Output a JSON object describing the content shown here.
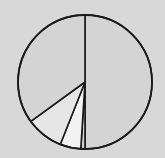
{
  "chart_data": {
    "type": "pie",
    "title": "",
    "start_angle_deg": 0,
    "direction": "clockwise",
    "labels": [
      "",
      "",
      "",
      "",
      ""
    ],
    "values": [
      50,
      1,
      5,
      9,
      35
    ],
    "colors": [
      "#d4d4d4",
      "#cfcfcf",
      "#f2f2f2",
      "#e6e6e6",
      "#d4d4d4"
    ],
    "legend": [],
    "center": [
      85,
      82
    ],
    "radius": 67
  },
  "background": "#d8d8d8",
  "edge_color": "#1a1a1a"
}
